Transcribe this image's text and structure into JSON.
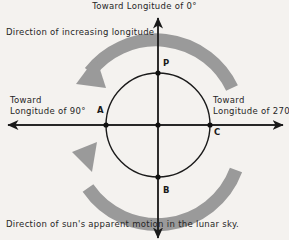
{
  "diagram": {
    "title_top": "Toward Longitude  of 0°",
    "label_increasing_longitude": "Direction of increasing longitude",
    "label_left_line1": "Toward",
    "label_left_line2": "Longitude of  90°",
    "label_right_line1": "Toward",
    "label_right_line2": "Longitude of 270°",
    "label_bottom": "Direction of sun's apparent motion in the lunar sky.",
    "points": [
      {
        "id": "P",
        "label": "P",
        "position": "top"
      },
      {
        "id": "A",
        "label": "A",
        "position": "left"
      },
      {
        "id": "B",
        "label": "B",
        "position": "bottom"
      },
      {
        "id": "C",
        "label": "C",
        "position": "right"
      }
    ],
    "colors": {
      "background": "#f4f2ef",
      "ink": "#1a1a1a",
      "arrow_gray": "#9a9a9a",
      "text": "#262626"
    },
    "geometry": {
      "center_x": 158,
      "center_y": 125,
      "circle_radius": 52,
      "arc_radius": 84,
      "arc_thickness": 13,
      "vertical_axis_top": 18,
      "vertical_axis_bottom": 238,
      "horizontal_axis_left": 8,
      "horizontal_axis_right": 283
    },
    "rotation_direction": "counterclockwise"
  }
}
